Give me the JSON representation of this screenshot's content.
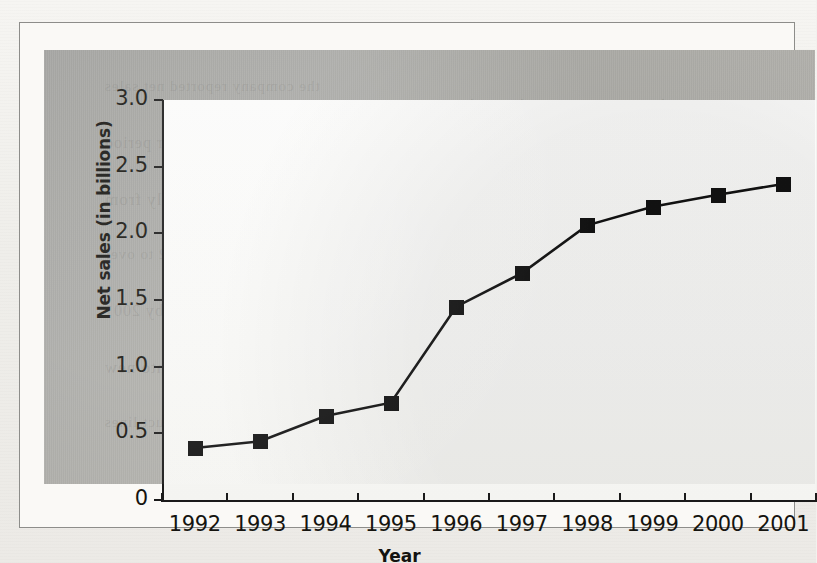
{
  "figure": {
    "background_color": "#b0afab",
    "plot_background_color": "#f8f8f6",
    "line_color": "#121212",
    "marker_color": "#121212"
  },
  "bleed_through_text": [
    "the company reported net sales",
    "growth over the ten year period",
    "which increased steadily from",
    "a modest base in 1992 to over",
    "two billion dollars by 2001",
    "reflecting expansion into new",
    "markets and product lines"
  ],
  "chart_data": {
    "type": "line",
    "title": "",
    "xlabel": "Year",
    "ylabel": "Net sales (in billions)",
    "categories": [
      "1992",
      "1993",
      "1994",
      "1995",
      "1996",
      "1997",
      "1998",
      "1999",
      "2000",
      "2001"
    ],
    "values": [
      0.39,
      0.44,
      0.63,
      0.73,
      1.45,
      1.7,
      2.06,
      2.2,
      2.29,
      2.37
    ],
    "series": [
      {
        "name": "Net sales",
        "values": [
          0.39,
          0.44,
          0.63,
          0.73,
          1.45,
          1.7,
          2.06,
          2.2,
          2.29,
          2.37
        ]
      }
    ],
    "ylim": [
      0,
      3.0
    ],
    "ytick_labels": [
      "0",
      "0.5",
      "1.0",
      "1.5",
      "2.0",
      "2.5",
      "3.0"
    ],
    "ytick_values": [
      0,
      0.5,
      1.0,
      1.5,
      2.0,
      2.5,
      3.0
    ],
    "xtick_labels": [
      "1992",
      "1993",
      "1994",
      "1995",
      "1996",
      "1997",
      "1998",
      "1999",
      "2000",
      "2001"
    ],
    "grid": false,
    "legend": false,
    "marker": "square"
  }
}
